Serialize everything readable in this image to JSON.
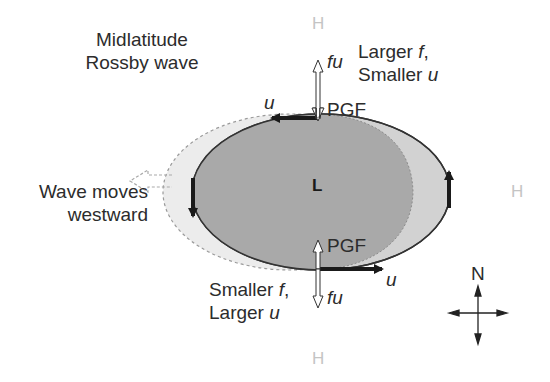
{
  "title": "Midlatitude Rossby wave",
  "labels": {
    "title_line1": "Midlatitude",
    "title_line2": "Rossby wave",
    "north_line1_a": "Larger ",
    "north_line1_f": "f",
    "north_line1_b": ",",
    "north_line2_a": "Smaller ",
    "north_line2_u": "u",
    "south_line1_a": "Smaller ",
    "south_line1_f": "f",
    "south_line1_b": ",",
    "south_line2_a": "Larger ",
    "south_line2_u": "u",
    "wave_line1": "Wave moves",
    "wave_line2": "westward",
    "low_center": "L",
    "high_top": "H",
    "high_right": "H",
    "high_bottom": "H",
    "fu_top": "fu",
    "fu_bottom": "fu",
    "pgf_top": "PGF",
    "pgf_bottom": "PGF",
    "u_top": "u",
    "u_bottom": "u",
    "compass_north": "N"
  },
  "colors": {
    "low_fill": "#a9a9a9",
    "shifted_fill": "#d0d0d0",
    "old_fill": "#ececec",
    "outline": "#333333",
    "high_text": "#c4c4c4"
  }
}
